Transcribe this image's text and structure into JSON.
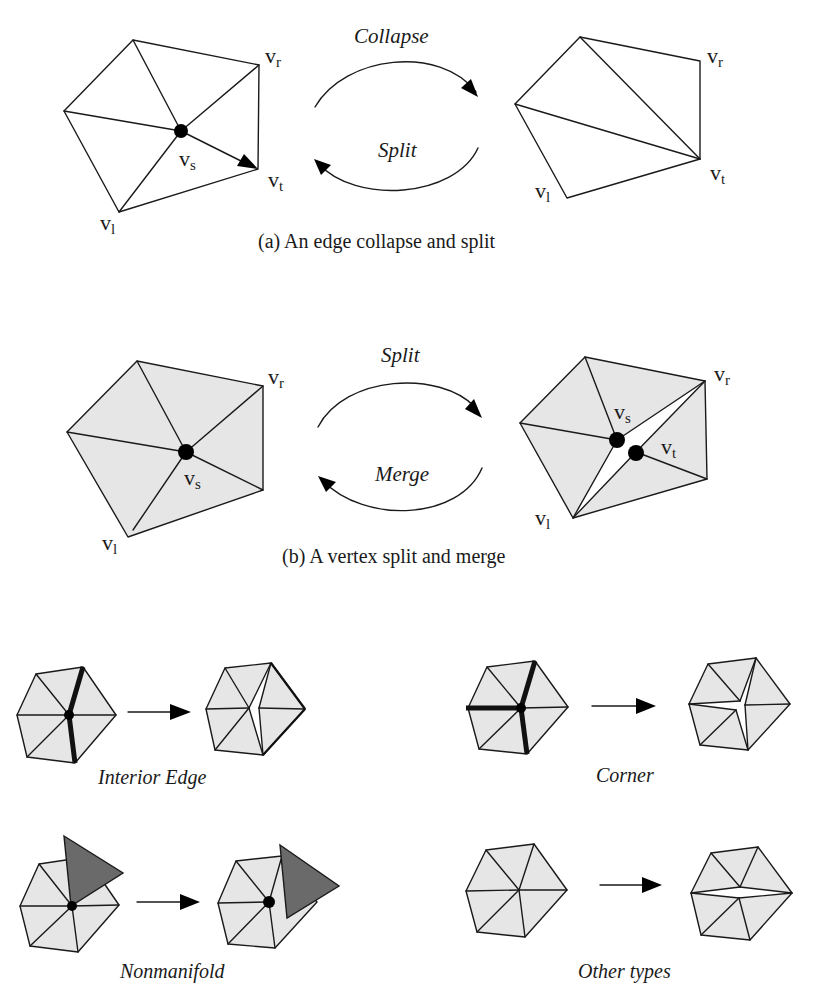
{
  "figure": {
    "panel_a": {
      "caption": "(a) An edge collapse and split",
      "forward_op": "Collapse",
      "backward_op": "Split",
      "before_labels": {
        "vr": "r",
        "vs": "s",
        "vt": "t",
        "vl": "l"
      },
      "after_labels": {
        "vr": "r",
        "vt": "t",
        "vl": "l"
      }
    },
    "panel_b": {
      "caption": "(b) A vertex split and merge",
      "forward_op": "Split",
      "backward_op": "Merge",
      "before_labels": {
        "vr": "r",
        "vs": "s",
        "vl": "l"
      },
      "after_labels": {
        "vr": "r",
        "vs": "s",
        "vt": "t",
        "vl": "l"
      }
    },
    "vertex_prefix": "v",
    "split_types": [
      {
        "label": "Interior Edge"
      },
      {
        "label": "Corner"
      },
      {
        "label": "Nonmanifold"
      },
      {
        "label": "Other types"
      }
    ],
    "colors": {
      "face_fill": "#e6e6e6",
      "nonmanifold_face": "#6a6a6a",
      "stroke": "#1a1a1a",
      "background": "#ffffff"
    }
  }
}
